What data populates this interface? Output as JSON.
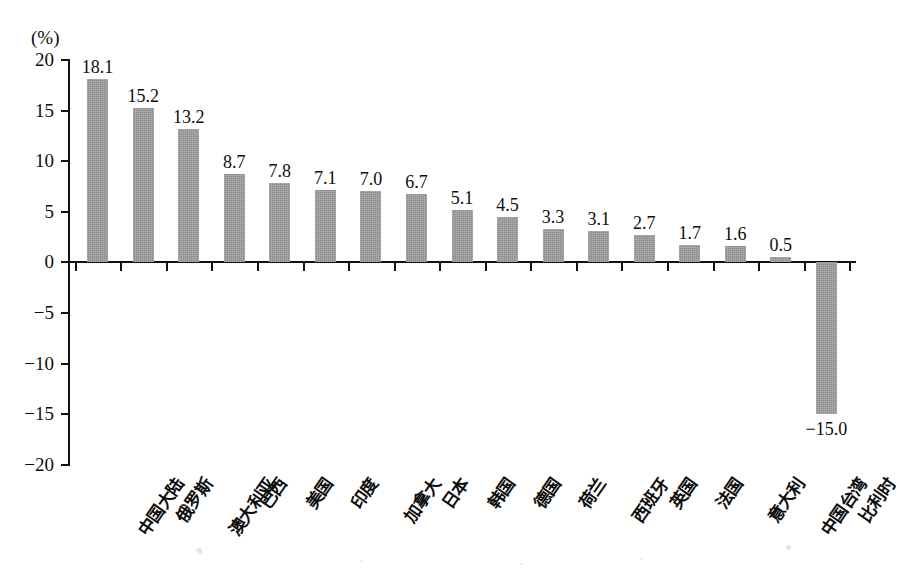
{
  "chart_data": {
    "type": "bar",
    "title": "",
    "subtitle": "",
    "xlabel": "",
    "ylabel": "",
    "unit_label": "(%)",
    "ylim": [
      -20,
      20
    ],
    "ytick_step": 5,
    "ytick_labels": [
      "20",
      "15",
      "10",
      "5",
      "0",
      "−5",
      "−10",
      "−15",
      "−20"
    ],
    "ytick_values": [
      20,
      15,
      10,
      5,
      0,
      -5,
      -10,
      -15,
      -20
    ],
    "grid": false,
    "legend": "none",
    "categories": [
      "中国大陆",
      "俄罗斯",
      "澳大利亚",
      "巴西",
      "美国",
      "印度",
      "加拿大",
      "日本",
      "韩国",
      "德国",
      "荷兰",
      "西班牙",
      "英国",
      "法国",
      "意大利",
      "中国台湾",
      "比利时"
    ],
    "values": [
      18.1,
      15.2,
      13.2,
      8.7,
      7.8,
      7.1,
      7.0,
      6.7,
      5.1,
      4.5,
      3.3,
      3.1,
      2.7,
      1.7,
      1.6,
      0.5,
      -15.0
    ],
    "value_labels": [
      "18.1",
      "15.2",
      "13.2",
      "8.7",
      "7.8",
      "7.1",
      "7.0",
      "6.7",
      "5.1",
      "4.5",
      "3.3",
      "3.1",
      "2.7",
      "1.7",
      "1.6",
      "0.5",
      "−15.0"
    ],
    "bar_color": "#9c9c9c",
    "axis_color": "#111111"
  }
}
